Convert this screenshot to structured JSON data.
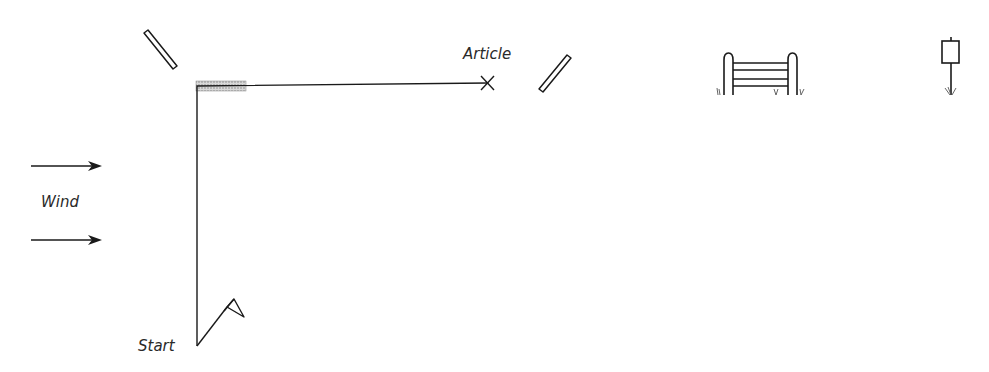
{
  "labels": {
    "article": "Article",
    "wind": "Wind",
    "start": "Start"
  },
  "elements": {
    "start_flag": "start-flag-icon",
    "article_marker": "x-marker",
    "poles": [
      "pole-icon",
      "pole-icon"
    ],
    "fence": "fence-gate-icon",
    "signpost": "signpost-icon",
    "wind_arrows": [
      "arrow-right-icon",
      "arrow-right-icon"
    ],
    "scent_zone": "hatched-band"
  },
  "colors": {
    "stroke": "#1a1a1a",
    "hatch": "#b5b5b5"
  }
}
